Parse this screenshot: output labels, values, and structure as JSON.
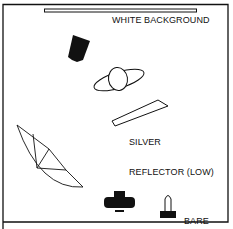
{
  "diagram": {
    "colors": {
      "ink": "#111111",
      "paper": "#ffffff"
    },
    "labels": {
      "background": "WHITE BACKGROUND",
      "reflector_line1": "SILVER",
      "reflector_line2": "REFLECTOR (LOW)",
      "flash_line1": "BARE",
      "flash_line2": "FLASH"
    },
    "elements": [
      {
        "id": "white-background",
        "type": "backdrop",
        "icon": "backdrop-bar"
      },
      {
        "id": "key-light",
        "type": "light",
        "icon": "softbox-icon"
      },
      {
        "id": "subject",
        "type": "person",
        "icon": "person-topview-icon"
      },
      {
        "id": "silver-reflector",
        "type": "reflector",
        "icon": "reflector-panel"
      },
      {
        "id": "umbrella",
        "type": "light-modifier",
        "icon": "umbrella-icon"
      },
      {
        "id": "camera",
        "type": "camera",
        "icon": "camera-icon"
      },
      {
        "id": "bare-flash",
        "type": "light",
        "icon": "bare-flash-icon"
      }
    ]
  }
}
